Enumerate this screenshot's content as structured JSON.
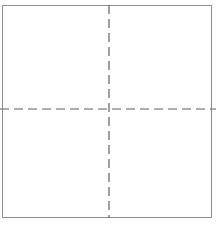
{
  "figure": {
    "canvas": {
      "width": 222,
      "height": 226,
      "background_color": "#ffffff"
    },
    "outline": {
      "name": "square-outline",
      "shape": "rectangle",
      "left": 2,
      "top": 5,
      "width": 210,
      "height": 213,
      "stroke_color": "#8e8e8e",
      "stroke_width": 1,
      "line_style": "solid",
      "fill": "none"
    },
    "centerlines": {
      "stroke_color": "#5f5f5f",
      "stroke_width": 1.2,
      "line_style": "dashed",
      "dash_length": 9,
      "gap_length": 5,
      "vertical": {
        "name": "vertical-centerline",
        "x": 109,
        "y_start": 5,
        "y_end": 218
      },
      "horizontal": {
        "name": "horizontal-centerline",
        "y": 109,
        "x_start": 0,
        "x_end": 216
      },
      "intersection": {
        "x": 109,
        "y": 109
      }
    },
    "quadrants": [
      {
        "name": "quadrant-top-left",
        "label": ""
      },
      {
        "name": "quadrant-top-right",
        "label": ""
      },
      {
        "name": "quadrant-bottom-left",
        "label": ""
      },
      {
        "name": "quadrant-bottom-right",
        "label": ""
      }
    ]
  }
}
